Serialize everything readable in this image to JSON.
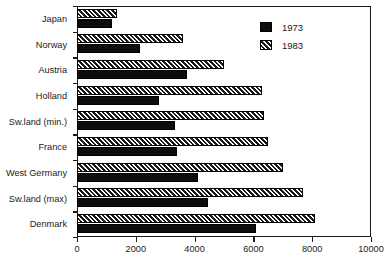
{
  "chart_data": {
    "type": "bar",
    "orientation": "horizontal",
    "title": "",
    "subtitle": "",
    "xlabel": "",
    "ylabel": "",
    "xlim": [
      0,
      10000
    ],
    "ylim": null,
    "grid": false,
    "legend_position": "top-right",
    "xticks": [
      0,
      2000,
      4000,
      6000,
      8000,
      10000
    ],
    "xtick_labels": [
      "0",
      "2000",
      "4000",
      "6000",
      "8000",
      "10000"
    ],
    "categories": [
      "Japan",
      "Norway",
      "Austria",
      "Holland",
      "Sw.land (min.)",
      "France",
      "West Germany",
      "Sw.land (max)",
      "Denmark"
    ],
    "series": [
      {
        "name": "1973",
        "pattern": "solid",
        "color": "#0d0d0d",
        "values": [
          1200,
          2150,
          3750,
          2800,
          3350,
          3400,
          4100,
          4450,
          6100
        ]
      },
      {
        "name": "1983",
        "pattern": "diagonal-hatch",
        "color": "#1a1a1a",
        "values": [
          1350,
          3600,
          5000,
          6300,
          6350,
          6500,
          7000,
          7700,
          8100
        ]
      }
    ]
  },
  "legend": {
    "entries": [
      {
        "label": "1973",
        "swatch": "solid-swatch"
      },
      {
        "label": "1983",
        "swatch": "hatched-swatch"
      }
    ]
  },
  "colors": {
    "axis": "#1a1a1a",
    "background": "#ffffff",
    "series_1973": "#0d0d0d",
    "series_1983": "#1a1a1a"
  }
}
